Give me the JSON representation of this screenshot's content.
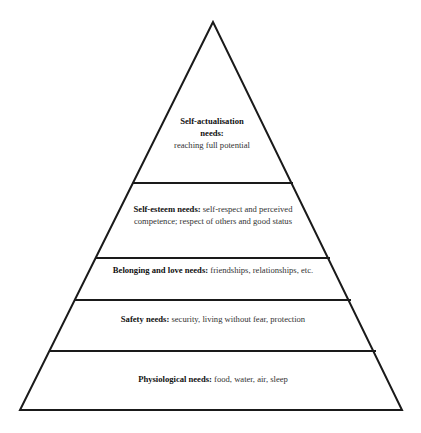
{
  "diagram": {
    "type": "pyramid",
    "title": "",
    "levels": [
      {
        "id": "self-actualisation",
        "heading": "Self-actualisation needs:",
        "description": "reaching full potential"
      },
      {
        "id": "self-esteem",
        "heading": "Self-esteem needs:",
        "description": "self-respect and perceived competence; respect of others and good status"
      },
      {
        "id": "belonging-love",
        "heading": "Belonging and love needs:",
        "description": "friendships, relationships, etc."
      },
      {
        "id": "safety",
        "heading": "Safety needs:",
        "description": "security, living without fear, protection"
      },
      {
        "id": "physiological",
        "heading": "Physiological needs:",
        "description": "food, water, air, sleep"
      }
    ]
  }
}
